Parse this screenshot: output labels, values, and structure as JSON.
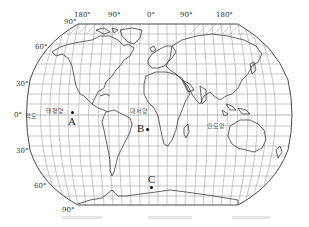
{
  "map": {
    "projection": "Robinson world map (pseudo-cylindrical)",
    "longitude_labels": [
      "180°",
      "90°",
      "0°",
      "90°",
      "180°"
    ],
    "latitude_labels": {
      "north_90": "90°",
      "north_60": "60°",
      "north_30": "30°",
      "equator": "0°",
      "equator_name": "적도",
      "south_30": "30°",
      "south_60": "60°",
      "south_90": "90°"
    },
    "oceans": {
      "pacific": "태평양",
      "atlantic": "대서양",
      "indian": "인도양"
    },
    "points": [
      {
        "label": "A",
        "location": "Eastern Pacific near equator"
      },
      {
        "label": "B",
        "location": "South Atlantic, near equator"
      },
      {
        "label": "C",
        "location": "Southern Ocean, ~60°S"
      }
    ],
    "colors": {
      "grid": "#9a9a9a",
      "coast": "#444444",
      "frame": "#555555",
      "point": "#111111"
    }
  }
}
